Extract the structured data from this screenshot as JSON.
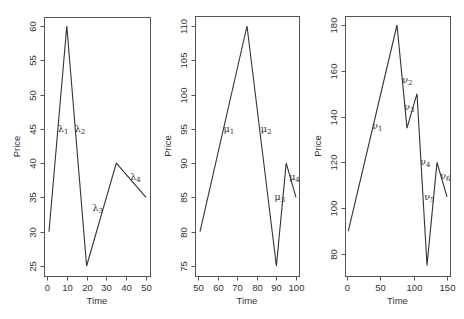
{
  "chart_data": [
    {
      "type": "line",
      "title": "",
      "xlabel": "Time",
      "ylabel": "Price",
      "x": [
        1,
        10,
        20,
        35,
        50
      ],
      "values": [
        30,
        60,
        25,
        40,
        35
      ],
      "xlim": [
        0,
        50
      ],
      "ylim": [
        25,
        60
      ],
      "xticks": [
        0,
        10,
        20,
        30,
        40,
        50
      ],
      "yticks": [
        25,
        30,
        35,
        40,
        45,
        50,
        55,
        60
      ],
      "grid": false,
      "annotations": [
        {
          "symbol": "λ",
          "sub": "1",
          "x": 5.5,
          "y": 45
        },
        {
          "symbol": "λ",
          "sub": "2",
          "x": 14,
          "y": 45
        },
        {
          "symbol": "λ",
          "sub": "3",
          "x": 23,
          "y": 33.5
        },
        {
          "symbol": "λ",
          "sub": "4",
          "x": 42,
          "y": 38
        }
      ]
    },
    {
      "type": "line",
      "title": "",
      "xlabel": "Time",
      "ylabel": "Price",
      "x": [
        51,
        75,
        90,
        95,
        100
      ],
      "values": [
        80,
        110,
        75,
        90,
        85
      ],
      "xlim": [
        50,
        100
      ],
      "ylim": [
        75,
        110
      ],
      "xticks": [
        50,
        60,
        70,
        80,
        90,
        100
      ],
      "yticks": [
        75,
        80,
        85,
        90,
        95,
        100,
        105,
        110
      ],
      "grid": false,
      "annotations": [
        {
          "symbol": "μ",
          "sub": "1",
          "x": 63,
          "y": 95
        },
        {
          "symbol": "μ",
          "sub": "2",
          "x": 82,
          "y": 95
        },
        {
          "symbol": "μ",
          "sub": "3",
          "x": 89,
          "y": 85
        },
        {
          "symbol": "μ",
          "sub": "4",
          "x": 96.5,
          "y": 88
        }
      ]
    },
    {
      "type": "line",
      "title": "",
      "xlabel": "Time",
      "ylabel": "Price",
      "x": [
        2,
        75,
        90,
        105,
        120,
        135,
        150
      ],
      "values": [
        90,
        180,
        135,
        150,
        75,
        120,
        105
      ],
      "xlim": [
        0,
        150
      ],
      "ylim": [
        80,
        180
      ],
      "xticks": [
        0,
        50,
        100,
        150
      ],
      "yticks": [
        80,
        100,
        120,
        140,
        160,
        180
      ],
      "grid": false,
      "annotations": [
        {
          "symbol": "ν",
          "sub": "1",
          "x": 38,
          "y": 136
        },
        {
          "symbol": "ν",
          "sub": "2",
          "x": 83,
          "y": 156
        },
        {
          "symbol": "ν",
          "sub": "3",
          "x": 86,
          "y": 144
        },
        {
          "symbol": "ν",
          "sub": "4",
          "x": 110,
          "y": 120
        },
        {
          "symbol": "ν",
          "sub": "5",
          "x": 116,
          "y": 105
        },
        {
          "symbol": "ν",
          "sub": "6",
          "x": 140,
          "y": 114
        }
      ]
    }
  ],
  "layout": {
    "panels": [
      {
        "left": 44,
        "right": 150,
        "top": 17,
        "bottom": 276,
        "x0px": 47,
        "x1px": 146,
        "y0px": 266,
        "y1px": 26
      },
      {
        "left": 195,
        "right": 299,
        "top": 16,
        "bottom": 276,
        "x0px": 198,
        "x1px": 296,
        "y0px": 266,
        "y1px": 26
      },
      {
        "left": 345,
        "right": 450,
        "top": 16,
        "bottom": 276,
        "x0px": 347,
        "x1px": 447,
        "y0px": 254,
        "y1px": 25
      }
    ]
  }
}
